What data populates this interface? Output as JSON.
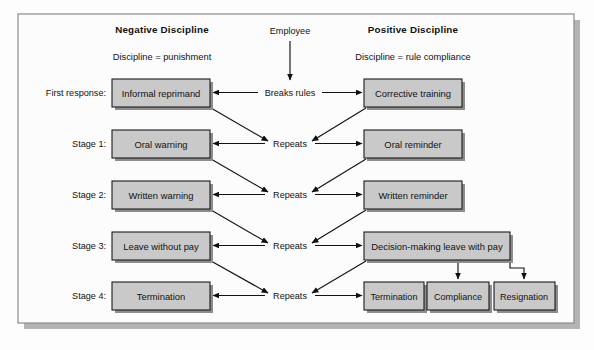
{
  "diagram": {
    "title_left": "Negative Discipline",
    "subtitle_left": "Discipline = punishment",
    "title_right": "Positive Discipline",
    "subtitle_right": "Discipline = rule compliance",
    "entry_label": "Employee",
    "trigger_label": "Breaks rules",
    "repeat_label": "Repeats",
    "colors": {
      "box_fill": "#c9c9c9",
      "box_stroke": "#1a1a1a",
      "frame_stroke": "#8a8a8a",
      "shadow": "#b4b4b4",
      "text": "#111111",
      "page_background": "#fdfdfd"
    },
    "stage_labels": [
      "First response:",
      "Stage 1:",
      "Stage 2:",
      "Stage 3:",
      "Stage 4:"
    ],
    "rows": [
      {
        "stage": "First response:",
        "negative": "Informal reprimand",
        "center": "Breaks rules",
        "positive": "Corrective training"
      },
      {
        "stage": "Stage 1:",
        "negative": "Oral warning",
        "center": "Repeats",
        "positive": "Oral reminder"
      },
      {
        "stage": "Stage 2:",
        "negative": "Written warning",
        "center": "Repeats",
        "positive": "Written reminder"
      },
      {
        "stage": "Stage 3:",
        "negative": "Leave without pay",
        "center": "Repeats",
        "positive": "Decision-making leave with pay"
      },
      {
        "stage": "Stage 4:",
        "negative": "Termination",
        "center": "Repeats",
        "positive": "Termination"
      }
    ],
    "outcomes": [
      "Termination",
      "Compliance",
      "Resignation"
    ]
  }
}
